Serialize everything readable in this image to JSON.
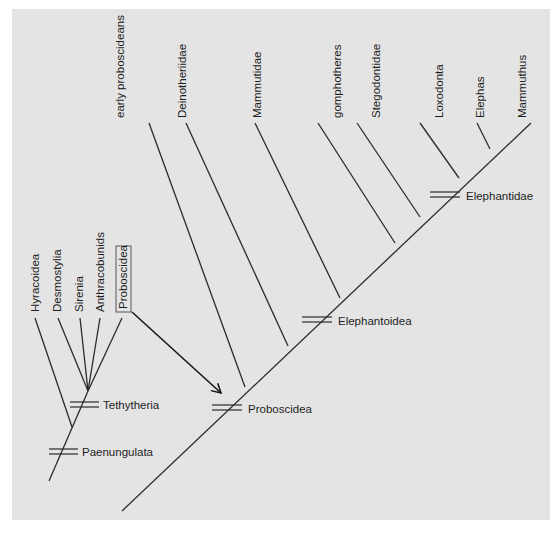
{
  "diagram": {
    "type": "cladogram",
    "colors": {
      "background": "#e4e4e4",
      "line": "#2b2b2b",
      "text": "#1e1e1e"
    },
    "left_tree": {
      "taxa": [
        {
          "label": "Hyracoidea",
          "boxed": false
        },
        {
          "label": "Desmostylia",
          "boxed": false
        },
        {
          "label": "Sirenia",
          "boxed": false
        },
        {
          "label": "Anthracobunids",
          "boxed": false
        },
        {
          "label": "Proboscidea",
          "boxed": true
        }
      ],
      "clades": [
        {
          "label": "Tethytheria"
        },
        {
          "label": "Paenungulata"
        }
      ]
    },
    "right_tree": {
      "taxa": [
        {
          "label": "early proboscideans"
        },
        {
          "label": "Deinotheriidae"
        },
        {
          "label": "Mammutidae"
        },
        {
          "label": "gomphotheres"
        },
        {
          "label": "Stegodontidae"
        },
        {
          "label": "Loxodonta"
        },
        {
          "label": "Elephas"
        },
        {
          "label": "Mammuthus"
        }
      ],
      "clades": [
        {
          "label": "Proboscidea"
        },
        {
          "label": "Elephantoidea"
        },
        {
          "label": "Elephantidae"
        }
      ]
    },
    "arrow": {
      "from": "Proboscidea (boxed, left tree)",
      "to": "Proboscidea node (right tree)"
    }
  }
}
